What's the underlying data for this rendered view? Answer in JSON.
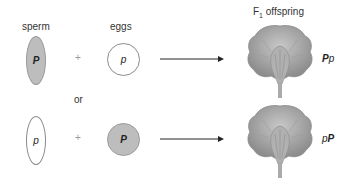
{
  "headers": {
    "sperm": "sperm",
    "eggs": "eggs",
    "offspring_prefix": "F",
    "offspring_sub": "1",
    "offspring_suffix": " offspring"
  },
  "connector": "or",
  "plus": "+",
  "crosses": [
    {
      "sperm": {
        "allele": "P",
        "dominant": true,
        "shape": "ellipse",
        "fill": "#bdbdbd"
      },
      "egg": {
        "allele": "p",
        "dominant": false,
        "shape": "circle",
        "fill": "#ffffff"
      },
      "genotype": {
        "first": "P",
        "second": "p"
      }
    },
    {
      "sperm": {
        "allele": "p",
        "dominant": false,
        "shape": "ellipse",
        "fill": "#ffffff"
      },
      "egg": {
        "allele": "P",
        "dominant": true,
        "shape": "circle",
        "fill": "#bdbdbd"
      },
      "genotype": {
        "first": "p",
        "second": "P"
      }
    }
  ],
  "colors": {
    "dominant_fill": "#bdbdbd",
    "outline": "#8a8a8a",
    "arrow": "#222222",
    "flower": "#9a9a9a"
  }
}
